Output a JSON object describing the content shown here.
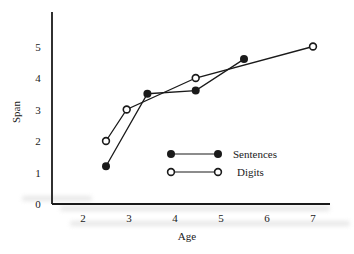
{
  "chart_data": {
    "type": "line",
    "title": "",
    "xlabel": "Age",
    "ylabel": "Span",
    "xlim": [
      1.4,
      7.4
    ],
    "ylim": [
      0,
      6
    ],
    "x_ticks": [
      "2",
      "3",
      "4",
      "5",
      "6",
      "7"
    ],
    "y_ticks": [
      "0",
      "1",
      "2",
      "3",
      "4",
      "5"
    ],
    "grid": false,
    "legend_position": "inside-lower-right",
    "series": [
      {
        "name": "Sentences",
        "marker": "filled-circle",
        "x": [
          2.5,
          3.4,
          4.45,
          5.5
        ],
        "y": [
          1.2,
          3.5,
          3.6,
          4.6
        ]
      },
      {
        "name": "Digits",
        "marker": "open-circle",
        "x": [
          2.5,
          2.95,
          4.45,
          7.0
        ],
        "y": [
          2.0,
          3.0,
          4.0,
          5.0
        ]
      }
    ]
  },
  "legend": {
    "sentences_label": "Sentences",
    "digits_label": "Digits"
  },
  "axes": {
    "x_title": "Age",
    "y_title": "Span"
  }
}
